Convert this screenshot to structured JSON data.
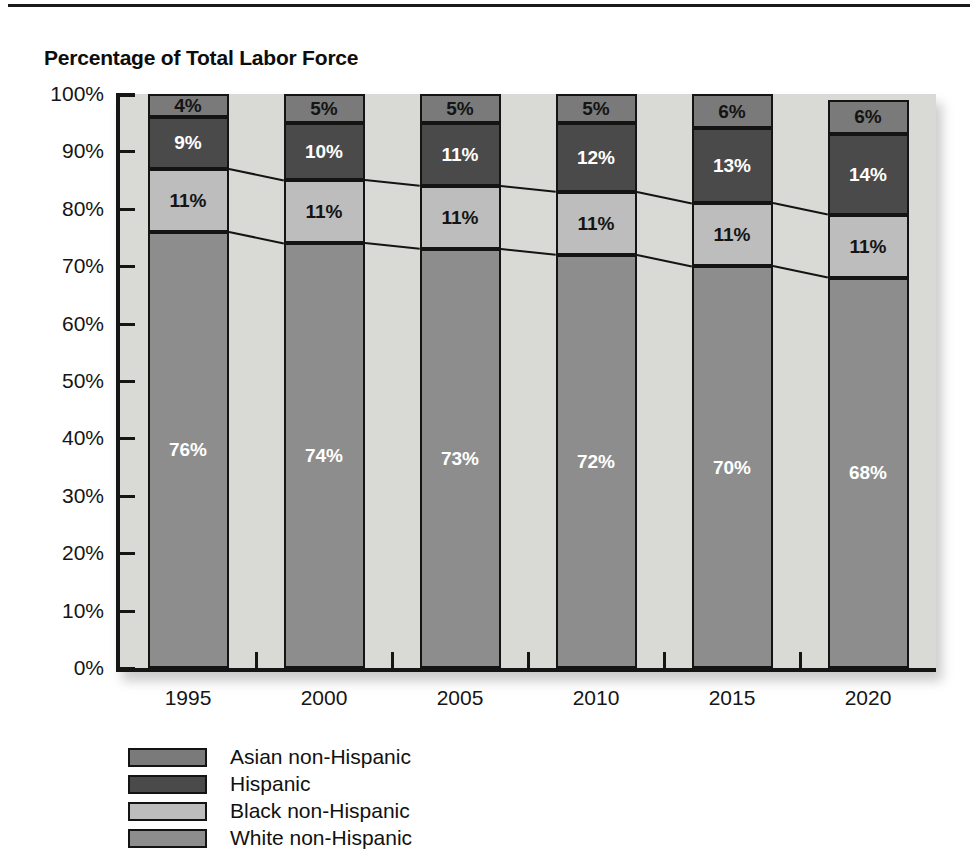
{
  "header": {
    "title": "Percentage of Total Labor Force"
  },
  "chart_data": {
    "type": "bar",
    "stacked": true,
    "title": "Percentage of Total Labor Force",
    "xlabel": "",
    "ylabel": "",
    "ylim": [
      0,
      100
    ],
    "ytick_labels": [
      "100%",
      "90%",
      "80%",
      "70%",
      "60%",
      "50%",
      "40%",
      "30%",
      "20%",
      "10%",
      "0%"
    ],
    "ytick_values": [
      100,
      90,
      80,
      70,
      60,
      50,
      40,
      30,
      20,
      10,
      0
    ],
    "grid": false,
    "legend_position": "bottom-left",
    "categories": [
      "1995",
      "2000",
      "2005",
      "2010",
      "2015",
      "2020"
    ],
    "series": [
      {
        "name": "White non-Hispanic",
        "color": "#8d8d8d",
        "label_color": "#ffffff",
        "values": [
          76,
          74,
          73,
          72,
          70,
          68
        ],
        "labels": [
          "76%",
          "74%",
          "73%",
          "72%",
          "70%",
          "68%"
        ]
      },
      {
        "name": "Black non-Hispanic",
        "color": "#bdbdbd",
        "label_color": "#141414",
        "values": [
          11,
          11,
          11,
          11,
          11,
          11
        ],
        "labels": [
          "11%",
          "11%",
          "11%",
          "11%",
          "11%",
          "11%"
        ]
      },
      {
        "name": "Hispanic",
        "color": "#4a4a4a",
        "label_color": "#ffffff",
        "values": [
          9,
          10,
          11,
          12,
          13,
          14
        ],
        "labels": [
          "9%",
          "10%",
          "11%",
          "12%",
          "13%",
          "14%"
        ]
      },
      {
        "name": "Asian non-Hispanic",
        "color": "#7a7a7a",
        "label_color": "#141414",
        "values": [
          4,
          5,
          5,
          5,
          6,
          6
        ],
        "labels": [
          "4%",
          "5%",
          "5%",
          "5%",
          "6%",
          "6%"
        ]
      }
    ]
  },
  "legend": {
    "items": [
      {
        "label": "Asian non-Hispanic",
        "color": "#7a7a7a"
      },
      {
        "label": "Hispanic",
        "color": "#4a4a4a"
      },
      {
        "label": "Black non-Hispanic",
        "color": "#bdbdbd"
      },
      {
        "label": "White non-Hispanic",
        "color": "#8d8d8d"
      }
    ]
  },
  "colors": {
    "plot_background": "#d9d9d6",
    "axis": "#151515",
    "page_background": "#ffffff"
  }
}
